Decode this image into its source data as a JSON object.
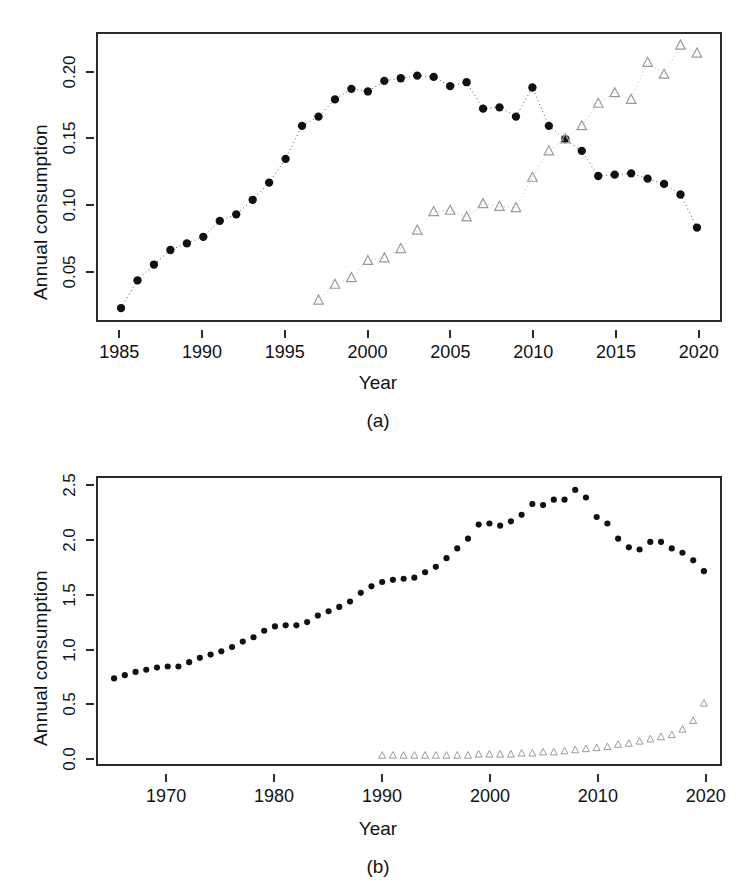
{
  "figure": {
    "background": "#ffffff",
    "series_colors": {
      "circles": "#111111",
      "triangles": "#9a9a9a"
    },
    "panels": [
      "(a)",
      "(b)"
    ]
  },
  "chart_data": [
    {
      "type": "scatter",
      "panel_label": "(a)",
      "title": "",
      "xlabel": "Year",
      "ylabel": "Annual consumption",
      "xlim": [
        1983.6,
        2021.4
      ],
      "ylim": [
        0.013,
        0.2295
      ],
      "xticks": [
        1985,
        1990,
        1995,
        2000,
        2005,
        2010,
        2015,
        2020
      ],
      "xtick_labels": [
        "1985",
        "1990",
        "1995",
        "2000",
        "2005",
        "2010",
        "2015",
        "2020"
      ],
      "yticks": [
        0.05,
        0.1,
        0.15,
        0.2
      ],
      "ytick_labels": [
        "0.05",
        "0.10",
        "0.15",
        "0.20"
      ],
      "grid": false,
      "legend": "none",
      "series": [
        {
          "name": "filled-circles",
          "marker": "circle",
          "color": "#111111",
          "linestyle": "dotted",
          "x": [
            1985,
            1986,
            1987,
            1988,
            1989,
            1990,
            1991,
            1992,
            1993,
            1994,
            1995,
            1996,
            1997,
            1998,
            1999,
            2000,
            2001,
            2002,
            2003,
            2004,
            2005,
            2006,
            2007,
            2008,
            2009,
            2010,
            2011,
            2012,
            2013,
            2014,
            2015,
            2016,
            2017,
            2018,
            2019,
            2020
          ],
          "y": [
            0.022,
            0.043,
            0.055,
            0.066,
            0.071,
            0.076,
            0.088,
            0.093,
            0.104,
            0.117,
            0.135,
            0.16,
            0.167,
            0.18,
            0.188,
            0.186,
            0.194,
            0.196,
            0.198,
            0.197,
            0.19,
            0.193,
            0.173,
            0.174,
            0.167,
            0.189,
            0.16,
            0.15,
            0.141,
            0.122,
            0.123,
            0.124,
            0.12,
            0.116,
            0.108,
            0.083
          ]
        },
        {
          "name": "open-triangles",
          "marker": "triangle",
          "color": "#9a9a9a",
          "linestyle": "dotted",
          "x": [
            1997,
            1998,
            1999,
            2000,
            2001,
            2002,
            2003,
            2004,
            2005,
            2006,
            2007,
            2008,
            2009,
            2010,
            2011,
            2012,
            2013,
            2014,
            2015,
            2016,
            2017,
            2018,
            2019,
            2020
          ],
          "y": [
            0.028,
            0.04,
            0.045,
            0.058,
            0.06,
            0.067,
            0.081,
            0.095,
            0.096,
            0.091,
            0.101,
            0.099,
            0.098,
            0.121,
            0.141,
            0.15,
            0.16,
            0.177,
            0.185,
            0.18,
            0.208,
            0.199,
            0.221,
            0.215
          ]
        }
      ]
    },
    {
      "type": "scatter",
      "panel_label": "(b)",
      "title": "",
      "xlabel": "Year",
      "ylabel": "Annual consumption",
      "xlim": [
        1963.5,
        2021.5
      ],
      "ylim": [
        -0.06,
        2.58
      ],
      "xticks": [
        1970,
        1980,
        1990,
        2000,
        2010,
        2020
      ],
      "xtick_labels": [
        "1970",
        "1980",
        "1990",
        "2000",
        "2010",
        "2020"
      ],
      "yticks": [
        0.0,
        0.5,
        1.0,
        1.5,
        2.0,
        2.5
      ],
      "ytick_labels": [
        "0.0",
        "0.5",
        "1.0",
        "1.5",
        "2.0",
        "2.5"
      ],
      "grid": false,
      "legend": "none",
      "series": [
        {
          "name": "filled-circles",
          "marker": "circle",
          "color": "#111111",
          "linestyle": "none",
          "x": [
            1965,
            1966,
            1967,
            1968,
            1969,
            1970,
            1971,
            1972,
            1973,
            1974,
            1975,
            1976,
            1977,
            1978,
            1979,
            1980,
            1981,
            1982,
            1983,
            1984,
            1985,
            1986,
            1987,
            1988,
            1989,
            1990,
            1991,
            1992,
            1993,
            1994,
            1995,
            1996,
            1997,
            1998,
            1999,
            2000,
            2001,
            2002,
            2003,
            2004,
            2005,
            2006,
            2007,
            2008,
            2009,
            2010,
            2011,
            2012,
            2013,
            2014,
            2015,
            2016,
            2017,
            2018,
            2019,
            2020
          ],
          "y": [
            0.73,
            0.76,
            0.79,
            0.81,
            0.83,
            0.84,
            0.84,
            0.88,
            0.92,
            0.95,
            0.98,
            1.02,
            1.07,
            1.11,
            1.17,
            1.21,
            1.22,
            1.22,
            1.25,
            1.31,
            1.35,
            1.39,
            1.44,
            1.52,
            1.58,
            1.62,
            1.64,
            1.65,
            1.66,
            1.71,
            1.76,
            1.84,
            1.93,
            2.02,
            2.15,
            2.16,
            2.14,
            2.18,
            2.24,
            2.34,
            2.33,
            2.38,
            2.38,
            2.47,
            2.4,
            2.22,
            2.16,
            2.02,
            1.94,
            1.92,
            1.99,
            1.99,
            1.93,
            1.89,
            1.82,
            1.72
          ]
        },
        {
          "name": "open-triangles",
          "marker": "triangle",
          "color": "#9a9a9a",
          "linestyle": "none",
          "x": [
            1990,
            1991,
            1992,
            1993,
            1994,
            1995,
            1996,
            1997,
            1998,
            1999,
            2000,
            2001,
            2002,
            2003,
            2004,
            2005,
            2006,
            2007,
            2008,
            2009,
            2010,
            2011,
            2012,
            2013,
            2014,
            2015,
            2016,
            2017,
            2018,
            2019,
            2020
          ],
          "y": [
            0.02,
            0.02,
            0.02,
            0.02,
            0.02,
            0.02,
            0.02,
            0.02,
            0.02,
            0.03,
            0.03,
            0.03,
            0.03,
            0.04,
            0.04,
            0.05,
            0.05,
            0.06,
            0.07,
            0.08,
            0.09,
            0.1,
            0.12,
            0.13,
            0.15,
            0.17,
            0.19,
            0.21,
            0.26,
            0.34,
            0.5
          ]
        }
      ]
    }
  ],
  "panel_a": {
    "letter": "(a)",
    "xlabel": "Year",
    "ylabel": "Annual consumption",
    "xtick_labels": [
      "1985",
      "1990",
      "1995",
      "2000",
      "2005",
      "2010",
      "2015",
      "2020"
    ],
    "ytick_labels": [
      "0.05",
      "0.10",
      "0.15",
      "0.20"
    ]
  },
  "panel_b": {
    "letter": "(b)",
    "xlabel": "Year",
    "ylabel": "Annual consumption",
    "xtick_labels": [
      "1970",
      "1980",
      "1990",
      "2000",
      "2010",
      "2020"
    ],
    "ytick_labels": [
      "0.0",
      "0.5",
      "1.0",
      "1.5",
      "2.0",
      "2.5"
    ]
  }
}
